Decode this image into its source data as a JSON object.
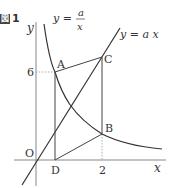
{
  "figure": {
    "label_box": "図",
    "label_number": "1"
  },
  "axes": {
    "x_label": "x",
    "y_label": "y",
    "origin_label": "O"
  },
  "curves": {
    "hyperbola_label_lhs": "y =",
    "hyperbola_numerator": "a",
    "hyperbola_denominator": "x",
    "line_label": "y = a x"
  },
  "points": {
    "A": "A",
    "B": "B",
    "C": "C",
    "D": "D"
  },
  "ticks": {
    "y_tick": "6",
    "x_tick": "2"
  },
  "colors": {
    "line": "#333333",
    "axis": "#777777",
    "dotted": "#999999"
  }
}
